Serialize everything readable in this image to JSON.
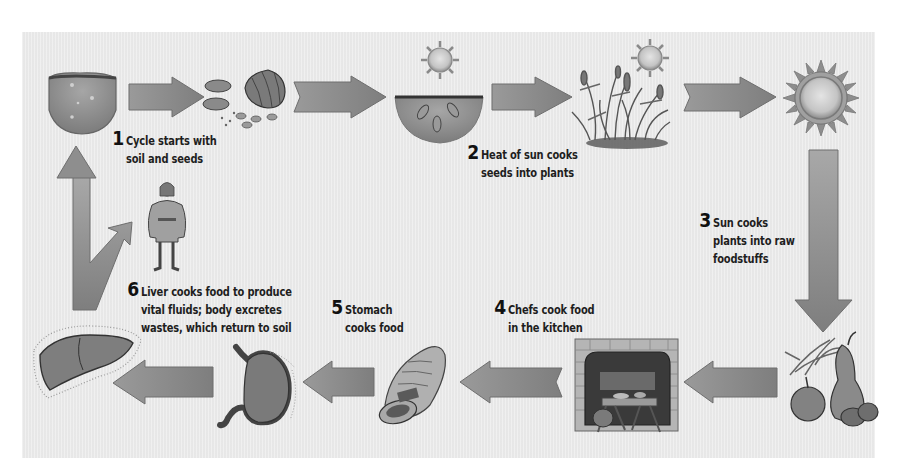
{
  "diagram": {
    "type": "cycle",
    "colors": {
      "background": "#ebebeb",
      "arrow_fill": "#8a8a8a",
      "arrow_stroke": "#6a6a6a",
      "text": "#1e1e1e"
    },
    "steps": [
      {
        "number": "1",
        "lines": [
          "Cycle starts with",
          "soil and seeds"
        ]
      },
      {
        "number": "2",
        "lines": [
          "Heat of sun cooks",
          "seeds into plants"
        ]
      },
      {
        "number": "3",
        "lines": [
          "Sun cooks",
          "plants into raw",
          "foodstuffs"
        ]
      },
      {
        "number": "4",
        "lines": [
          "Chefs cook food",
          "in the kitchen"
        ]
      },
      {
        "number": "5",
        "lines": [
          "Stomach",
          "cooks food"
        ]
      },
      {
        "number": "6",
        "lines": [
          "Liver cooks food to produce",
          "vital fluids; body excretes",
          "wastes, which return to soil"
        ]
      }
    ],
    "illustrations": [
      {
        "id": "soil",
        "icon": "soil-clump-icon"
      },
      {
        "id": "seeds",
        "icon": "seeds-icon"
      },
      {
        "id": "sun-small-1",
        "icon": "sun-icon"
      },
      {
        "id": "planted-seeds",
        "icon": "soil-with-seeds-icon"
      },
      {
        "id": "sun-small-2",
        "icon": "sun-icon"
      },
      {
        "id": "plants",
        "icon": "grain-plants-icon"
      },
      {
        "id": "sun-large",
        "icon": "sun-icon"
      },
      {
        "id": "foodstuffs",
        "icon": "fruit-and-grain-icon"
      },
      {
        "id": "kitchen",
        "icon": "hearth-kitchen-icon"
      },
      {
        "id": "bread",
        "icon": "bread-loaf-icon"
      },
      {
        "id": "stomach",
        "icon": "stomach-icon"
      },
      {
        "id": "liver",
        "icon": "liver-icon"
      },
      {
        "id": "person",
        "icon": "medieval-person-icon"
      }
    ]
  }
}
